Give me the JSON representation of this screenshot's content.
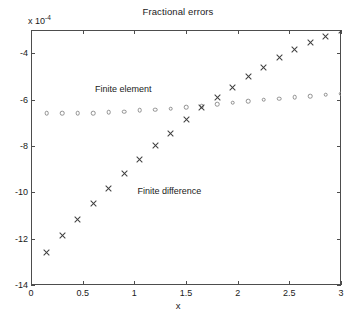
{
  "chart_data": {
    "type": "scatter",
    "title": "Fractional errors",
    "xlabel": "x",
    "ylabel": "",
    "y_exponent_label": "x 10",
    "y_exponent_power": "-4",
    "xlim": [
      0,
      3
    ],
    "ylim": [
      -14,
      -3
    ],
    "grid": false,
    "legend_position": "inline-annotations",
    "xticks": [
      0,
      0.5,
      1,
      1.5,
      2,
      2.5,
      3
    ],
    "xticklabels": [
      "0",
      "0.5",
      "1",
      "1.5",
      "2",
      "2.5",
      "3"
    ],
    "yticks": [
      -4,
      -6,
      -8,
      -10,
      -12,
      -14
    ],
    "yticklabels": [
      "-4",
      "-6",
      "-8",
      "-10",
      "-12",
      "-14"
    ],
    "series": [
      {
        "name": "Finite element",
        "marker": "circle",
        "color": "#8f8f8f",
        "annotation": "Finite element",
        "annotation_x": 0.62,
        "annotation_y": -5.35,
        "x": [
          0.15,
          0.3,
          0.45,
          0.6,
          0.75,
          0.9,
          1.05,
          1.2,
          1.35,
          1.5,
          1.65,
          1.8,
          1.95,
          2.1,
          2.25,
          2.4,
          2.55,
          2.7,
          2.85,
          3.0
        ],
        "y": [
          -6.6,
          -6.6,
          -6.59,
          -6.58,
          -6.54,
          -6.52,
          -6.47,
          -6.44,
          -6.39,
          -6.33,
          -6.28,
          -6.19,
          -6.14,
          -6.08,
          -6.01,
          -5.97,
          -5.91,
          -5.85,
          -5.79,
          -5.74
        ]
      },
      {
        "name": "Finite difference",
        "marker": "x",
        "color": "#3d3d3d",
        "annotation": "Finite difference",
        "annotation_x": 1.03,
        "annotation_y": -9.75,
        "x": [
          0.15,
          0.3,
          0.45,
          0.6,
          0.75,
          0.9,
          1.05,
          1.2,
          1.35,
          1.5,
          1.65,
          1.8,
          1.95,
          2.1,
          2.25,
          2.4,
          2.55,
          2.7,
          2.85,
          3.0
        ],
        "y": [
          -12.6,
          -11.88,
          -11.18,
          -10.48,
          -9.82,
          -9.2,
          -8.58,
          -8.0,
          -7.45,
          -6.88,
          -6.33,
          -5.93,
          -5.46,
          -5.02,
          -4.6,
          -4.2,
          -3.86,
          -3.55,
          -3.26,
          -3.0
        ]
      }
    ]
  }
}
